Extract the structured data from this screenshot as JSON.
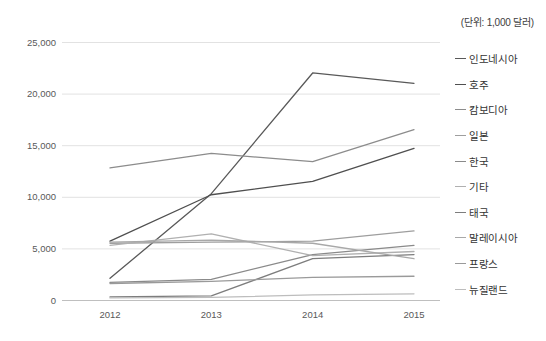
{
  "unit_note": "(단위: 1,000 달러)",
  "chart_data": {
    "type": "line",
    "title": "",
    "xlabel": "",
    "ylabel": "",
    "unit_note": "(단위: 1,000 달러)",
    "categories": [
      "2012",
      "2013",
      "2014",
      "2015"
    ],
    "x": [
      2012,
      2013,
      2014,
      2015
    ],
    "ylim": [
      0,
      25000
    ],
    "ytick_labels": [
      "0",
      "5,000",
      "10,000",
      "15,000",
      "20,000",
      "25,000"
    ],
    "yticks": [
      0,
      5000,
      10000,
      15000,
      20000,
      25000
    ],
    "grid": true,
    "legend_position": "right",
    "series": [
      {
        "name": "인도네시아",
        "color": "#595959",
        "values": [
          2100,
          10300,
          22000,
          21000
        ]
      },
      {
        "name": "호주",
        "color": "#4f4f4f",
        "values": [
          5700,
          10200,
          11500,
          14700
        ]
      },
      {
        "name": "캄보디아",
        "color": "#8c8c8c",
        "values": [
          12800,
          14200,
          13400,
          16500
        ]
      },
      {
        "name": "일본",
        "color": "#9e9e9e",
        "values": [
          5500,
          5600,
          5700,
          6700
        ]
      },
      {
        "name": "한국",
        "color": "#8a8a8a",
        "values": [
          1700,
          2000,
          4400,
          5300
        ]
      },
      {
        "name": "기타",
        "color": "#b0b0b0",
        "values": [
          5300,
          6400,
          4300,
          4700
        ]
      },
      {
        "name": "태국",
        "color": "#7d7d7d",
        "values": [
          300,
          400,
          4000,
          4400
        ]
      },
      {
        "name": "말레이시아",
        "color": "#a8a8a8",
        "values": [
          5600,
          5800,
          5500,
          4000
        ]
      },
      {
        "name": "프랑스",
        "color": "#9a9a9a",
        "values": [
          1600,
          1800,
          2200,
          2300
        ]
      },
      {
        "name": "뉴질랜드",
        "color": "#bdbdbd",
        "values": [
          200,
          250,
          500,
          600
        ]
      }
    ]
  },
  "legend": {
    "items": [
      {
        "label": "인도네시아"
      },
      {
        "label": "호주"
      },
      {
        "label": "캄보디아"
      },
      {
        "label": "일본"
      },
      {
        "label": "한국"
      },
      {
        "label": "기타"
      },
      {
        "label": "태국"
      },
      {
        "label": "말레이시아"
      },
      {
        "label": "프랑스"
      },
      {
        "label": "뉴질랜드"
      }
    ]
  }
}
